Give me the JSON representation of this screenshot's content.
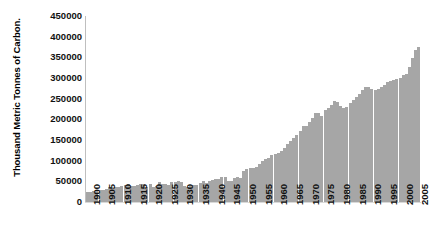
{
  "chart_data": {
    "type": "bar",
    "title": "",
    "subtitle": "",
    "xlabel": "",
    "ylabel": "Thousand Metric Tonnes of Carbon.",
    "ylim": [
      0,
      450000
    ],
    "ytick_labels": [
      "450000",
      "400000",
      "350000",
      "300000",
      "250000",
      "200000",
      "150000",
      "100000",
      "50000",
      "0"
    ],
    "ytick_values": [
      450000,
      400000,
      350000,
      300000,
      250000,
      200000,
      150000,
      100000,
      50000,
      0
    ],
    "ytick_step": 50000,
    "xtick_labels": [
      "1900",
      "1905",
      "1910",
      "1915",
      "1920",
      "1925",
      "1930",
      "1935",
      "1940",
      "1945",
      "1950",
      "1955",
      "1960",
      "1965",
      "1970",
      "1975",
      "1980",
      "1985",
      "1990",
      "1995",
      "2000",
      "2005"
    ],
    "xtick_step": 5,
    "grid": false,
    "legend": null,
    "legend_position": "none",
    "bar_color": "#a6a6a6",
    "axis_color": "#bfbfbf",
    "text_color": "#111111",
    "background_color": "#ffffff",
    "x": [
      1900,
      1901,
      1902,
      1903,
      1904,
      1905,
      1906,
      1907,
      1908,
      1909,
      1910,
      1911,
      1912,
      1913,
      1914,
      1915,
      1916,
      1917,
      1918,
      1919,
      1920,
      1921,
      1922,
      1923,
      1924,
      1925,
      1926,
      1927,
      1928,
      1929,
      1930,
      1931,
      1932,
      1933,
      1934,
      1935,
      1936,
      1937,
      1938,
      1939,
      1940,
      1941,
      1942,
      1943,
      1944,
      1945,
      1946,
      1947,
      1948,
      1949,
      1950,
      1951,
      1952,
      1953,
      1954,
      1955,
      1956,
      1957,
      1958,
      1959,
      1960,
      1961,
      1962,
      1963,
      1964,
      1965,
      1966,
      1967,
      1968,
      1969,
      1970,
      1971,
      1972,
      1973,
      1974,
      1975,
      1976,
      1977,
      1978,
      1979,
      1980,
      1981,
      1982,
      1983,
      1984,
      1985,
      1986,
      1987,
      1988,
      1989,
      1990,
      1991,
      1992,
      1993,
      1994,
      1995,
      1996,
      1997,
      1998,
      1999,
      2000,
      2001,
      2002,
      2003,
      2004,
      2005,
      2006
    ],
    "categories": [
      "1900",
      "1901",
      "1902",
      "1903",
      "1904",
      "1905",
      "1906",
      "1907",
      "1908",
      "1909",
      "1910",
      "1911",
      "1912",
      "1913",
      "1914",
      "1915",
      "1916",
      "1917",
      "1918",
      "1919",
      "1920",
      "1921",
      "1922",
      "1923",
      "1924",
      "1925",
      "1926",
      "1927",
      "1928",
      "1929",
      "1930",
      "1931",
      "1932",
      "1933",
      "1934",
      "1935",
      "1936",
      "1937",
      "1938",
      "1939",
      "1940",
      "1941",
      "1942",
      "1943",
      "1944",
      "1945",
      "1946",
      "1947",
      "1948",
      "1949",
      "1950",
      "1951",
      "1952",
      "1953",
      "1954",
      "1955",
      "1956",
      "1957",
      "1958",
      "1959",
      "1960",
      "1961",
      "1962",
      "1963",
      "1964",
      "1965",
      "1966",
      "1967",
      "1968",
      "1969",
      "1970",
      "1971",
      "1972",
      "1973",
      "1974",
      "1975",
      "1976",
      "1977",
      "1978",
      "1979",
      "1980",
      "1981",
      "1982",
      "1983",
      "1984",
      "1985",
      "1986",
      "1987",
      "1988",
      "1989",
      "1990",
      "1991",
      "1992",
      "1993",
      "1994",
      "1995",
      "1996",
      "1997",
      "1998",
      "1999",
      "2000",
      "2001",
      "2002",
      "2003",
      "2004",
      "2005",
      "2006"
    ],
    "values": [
      534,
      552,
      566,
      617,
      624,
      663,
      707,
      784,
      750,
      785,
      819,
      836,
      879,
      943,
      850,
      838,
      901,
      955,
      936,
      806,
      932,
      803,
      845,
      1053,
      937,
      981,
      927,
      1053,
      1085,
      1145,
      1053,
      872,
      820,
      839,
      895,
      929,
      1022,
      1102,
      1016,
      1117,
      1165,
      1205,
      1228,
      1311,
      1338,
      1143,
      1137,
      1275,
      1338,
      1305,
      1630,
      1767,
      1795,
      1841,
      1865,
      2043,
      2177,
      2270,
      2330,
      2500,
      2577,
      2594,
      2700,
      2900,
      3100,
      3230,
      3430,
      3550,
      3790,
      4060,
      4053,
      4238,
      4474,
      4756,
      4760,
      4606,
      4905,
      5027,
      5194,
      5378,
      5322,
      5137,
      5000,
      5077,
      5258,
      5439,
      5591,
      5756,
      5965,
      6130,
      6125,
      6050,
      5991,
      6035,
      6120,
      6228,
      6424,
      6429,
      6482,
      6534,
      6622,
      6765,
      6840,
      7197,
      7687,
      8097,
      8230
    ],
    "values_note": "Values shown in thousand metric tonnes of carbon; plotted series scaled by 1000 (e.g. 8230 -> 8,230,000?) See series_plotted for on-axis magnitudes.",
    "series_plotted": [
      534,
      552,
      566,
      617,
      624,
      663,
      707,
      784,
      750,
      785,
      819,
      836,
      879,
      943,
      850,
      838,
      901,
      955,
      936,
      806,
      932,
      803,
      845,
      1053,
      937,
      981,
      927,
      1053,
      1085,
      1145,
      1053,
      872,
      820,
      839,
      895,
      929,
      1022,
      1102,
      1016,
      1117,
      1165,
      1205,
      1228,
      1311,
      1338,
      1143,
      1137,
      1275,
      1338,
      1305,
      1630,
      1767,
      1795,
      1841,
      1865,
      2043,
      2177,
      2270,
      2330,
      2500,
      2577,
      2594,
      2700,
      2900,
      3100,
      3230,
      3430,
      3550,
      3790,
      4060,
      4053,
      4238,
      4474,
      4756,
      4760,
      4606,
      4905,
      5027,
      5194,
      5378,
      5322,
      5137,
      5000,
      5077,
      5258,
      5439,
      5591,
      5756,
      5965,
      6130,
      6125,
      6050,
      5991,
      6035,
      6120,
      6228,
      6424,
      6429,
      6482,
      6534,
      6622,
      6765,
      6840,
      7197,
      7687,
      8097,
      8230
    ],
    "plot_values": [
      24000,
      25000,
      26000,
      28000,
      28500,
      30000,
      32000,
      35500,
      34000,
      35500,
      37000,
      38000,
      40000,
      43000,
      38500,
      38000,
      41000,
      43500,
      42500,
      36500,
      42500,
      36500,
      38500,
      48000,
      42500,
      44500,
      42000,
      48000,
      49500,
      52000,
      48000,
      39500,
      37000,
      38000,
      40500,
      42000,
      46500,
      50000,
      46000,
      50500,
      53000,
      54500,
      55500,
      59500,
      60500,
      52000,
      51500,
      58000,
      60500,
      59000,
      74000,
      80000,
      81500,
      83500,
      84500,
      93000,
      99000,
      103000,
      106000,
      113500,
      117000,
      118000,
      122500,
      131500,
      140500,
      146500,
      155500,
      161000,
      172000,
      184000,
      184000,
      192500,
      203000,
      216000,
      216000,
      209000,
      222500,
      228000,
      235500,
      244000,
      241500,
      233000,
      227000,
      230500,
      238500,
      247000,
      254000,
      261500,
      271000,
      278500,
      278000,
      274500,
      272000,
      274000,
      278000,
      283000,
      291500,
      292000,
      294500,
      296500,
      300500,
      307000,
      310500,
      327000,
      349000,
      367500,
      375000
    ]
  },
  "axis": {
    "y_title": "Thousand Metric Tonnes of Carbon."
  }
}
